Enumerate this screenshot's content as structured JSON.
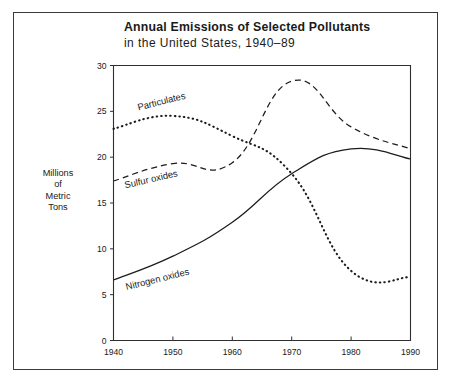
{
  "figure": {
    "width": 453,
    "height": 384,
    "background": "#ffffff",
    "frame_color": "#3a3a3a",
    "ink_color": "#1c1c1c"
  },
  "header": {
    "title": "Annual Emissions of Selected Pollutants",
    "subtitle": "in the United States, 1940–89"
  },
  "axis_title": {
    "line1": "Millions",
    "line2": "of",
    "line3": "Metric",
    "line4": "Tons"
  },
  "chart_data": {
    "type": "line",
    "xlabel": "",
    "ylabel": "Millions of Metric Tons",
    "xlim": [
      1940,
      1990
    ],
    "ylim": [
      0,
      30
    ],
    "xticks": [
      1940,
      1950,
      1960,
      1970,
      1980,
      1990
    ],
    "xtick_labels": [
      "1940",
      "1950",
      "1960",
      "1970",
      "1980",
      "1990"
    ],
    "yticks": [
      0,
      5,
      10,
      15,
      20,
      25,
      30
    ],
    "ytick_labels": [
      "0",
      "5",
      "10",
      "15",
      "20",
      "25",
      "30"
    ],
    "grid": false,
    "legend": "inline-labels",
    "x": [
      1940,
      1950,
      1960,
      1970,
      1980,
      1990
    ],
    "series": [
      {
        "name": "Particulates",
        "style": "dotted",
        "label_x": 1944.2,
        "label_y": 25.1,
        "label_rotation": -14,
        "values": [
          23.1,
          24.5,
          22.3,
          18.2,
          7.6,
          6.9
        ]
      },
      {
        "name": "Sulfur oxides",
        "style": "dashed",
        "label_x": 1942.0,
        "label_y": 16.6,
        "label_rotation": -13,
        "values": [
          17.4,
          19.3,
          19.4,
          28.3,
          23.3,
          20.9
        ]
      },
      {
        "name": "Nitrogen oxides",
        "style": "solid",
        "label_x": 1942.2,
        "label_y": 5.5,
        "label_rotation": -14,
        "values": [
          6.6,
          9.2,
          12.9,
          18.2,
          20.9,
          19.8
        ]
      }
    ]
  }
}
